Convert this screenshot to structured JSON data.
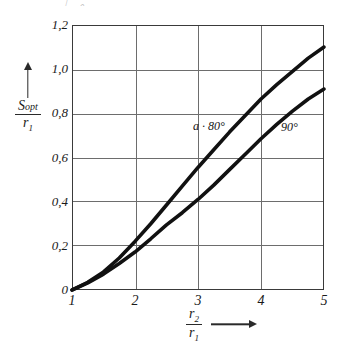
{
  "caption_remnant": "｜      ｡",
  "chart_data": {
    "type": "line",
    "title": "",
    "xlabel": "r2/r1",
    "ylabel": "Sopt/r1",
    "xlim": [
      1,
      5
    ],
    "ylim": [
      0,
      1.2
    ],
    "grid": true,
    "legend_position": "inline-annotation",
    "x_ticks": [
      "1",
      "2",
      "3",
      "4",
      "5"
    ],
    "y_ticks": [
      "0",
      "0,2",
      "0,4",
      "0,6",
      "0,8",
      "1,0",
      "1,2"
    ],
    "x_tick_values": [
      1,
      2,
      3,
      4,
      5
    ],
    "y_tick_values": [
      0,
      0.2,
      0.4,
      0.6,
      0.8,
      1.0,
      1.2
    ],
    "series": [
      {
        "name": "a = 80°",
        "label": "a · 80°",
        "x": [
          1.0,
          1.25,
          1.5,
          1.75,
          2.0,
          2.25,
          2.5,
          2.75,
          3.0,
          3.25,
          3.5,
          3.75,
          4.0,
          4.25,
          4.5,
          4.75,
          5.0
        ],
        "values": [
          0.0,
          0.035,
          0.082,
          0.145,
          0.22,
          0.3,
          0.385,
          0.47,
          0.555,
          0.635,
          0.715,
          0.79,
          0.865,
          0.93,
          0.99,
          1.05,
          1.1
        ]
      },
      {
        "name": "90°",
        "label": "90°",
        "x": [
          1.0,
          1.25,
          1.5,
          1.75,
          2.0,
          2.25,
          2.5,
          2.75,
          3.0,
          3.25,
          3.5,
          3.75,
          4.0,
          4.25,
          4.5,
          4.75,
          5.0
        ],
        "values": [
          0.0,
          0.032,
          0.072,
          0.12,
          0.172,
          0.232,
          0.295,
          0.35,
          0.41,
          0.475,
          0.545,
          0.615,
          0.685,
          0.75,
          0.81,
          0.865,
          0.91
        ]
      }
    ]
  },
  "axes": {
    "y_title_numerator": "S",
    "y_title_numerator_sub": "opt",
    "y_title_denominator": "r",
    "y_title_denominator_sub": "1",
    "x_title_numerator": "r",
    "x_title_numerator_sub": "2",
    "x_title_denominator": "r",
    "x_title_denominator_sub": "1"
  },
  "colors": {
    "curve": "#111111",
    "grid": "#6d6d6d",
    "frame": "#3a3a3a",
    "background": "#ffffff"
  }
}
